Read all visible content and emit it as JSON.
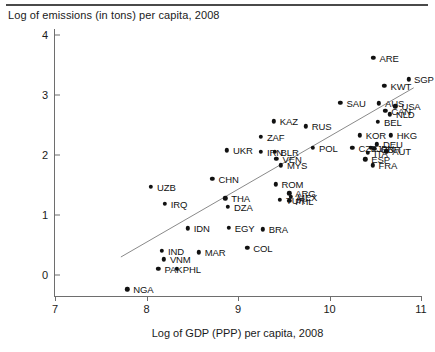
{
  "chart_data": {
    "type": "scatter",
    "title": "Log of emissions (in tons) per capita, 2008",
    "xlabel": "Log of GDP (PPP) per capita, 2008",
    "ylabel": "",
    "xlim": [
      7,
      11
    ],
    "ylim": [
      -0.35,
      4.1
    ],
    "xticks": [
      "7",
      "8",
      "9",
      "10",
      "11"
    ],
    "yticks": [
      "0",
      "1",
      "2",
      "3",
      "4"
    ],
    "grid": false,
    "legend": null,
    "trendline": {
      "x0": 7.72,
      "y0": 0.3,
      "x1": 10.92,
      "y1": 3.12
    },
    "points": [
      {
        "label": "ARE",
        "x": 10.48,
        "y": 3.62,
        "lx": 6
      },
      {
        "label": "SGP",
        "x": 10.87,
        "y": 3.26,
        "lx": 5
      },
      {
        "label": "KWT",
        "x": 10.6,
        "y": 3.15,
        "lx": 6
      },
      {
        "label": "AUS",
        "x": 10.54,
        "y": 2.86,
        "lx": 6
      },
      {
        "label": "USA",
        "x": 10.72,
        "y": 2.81,
        "lx": 6
      },
      {
        "label": "CAN",
        "x": 10.61,
        "y": 2.74,
        "lx": 6
      },
      {
        "label": "NLD",
        "x": 10.66,
        "y": 2.68,
        "lx": 6
      },
      {
        "label": "SAU",
        "x": 10.12,
        "y": 2.87,
        "lx": 6
      },
      {
        "label": "BEL",
        "x": 10.53,
        "y": 2.55,
        "lx": 6
      },
      {
        "label": "HKG",
        "x": 10.67,
        "y": 2.33,
        "lx": 6
      },
      {
        "label": "KOR",
        "x": 10.33,
        "y": 2.33,
        "lx": 6
      },
      {
        "label": "DEU",
        "x": 10.52,
        "y": 2.18,
        "lx": 6
      },
      {
        "label": "AUT",
        "x": 10.62,
        "y": 2.06,
        "lx": 6
      },
      {
        "label": "GBR",
        "x": 10.49,
        "y": 2.1,
        "lx": 6
      },
      {
        "label": "JPN",
        "x": 10.45,
        "y": 2.12,
        "lx": 6
      },
      {
        "label": "CZE",
        "x": 10.25,
        "y": 2.12,
        "lx": 6
      },
      {
        "label": "ITA",
        "x": 10.42,
        "y": 2.04,
        "lx": 6
      },
      {
        "label": "ESP",
        "x": 10.39,
        "y": 1.93,
        "lx": 6
      },
      {
        "label": "FRA",
        "x": 10.47,
        "y": 1.83,
        "lx": 6
      },
      {
        "label": "KAZ",
        "x": 9.39,
        "y": 2.56,
        "lx": 6
      },
      {
        "label": "RUS",
        "x": 9.74,
        "y": 2.48,
        "lx": 6
      },
      {
        "label": "ZAF",
        "x": 9.25,
        "y": 2.3,
        "lx": 6
      },
      {
        "label": "POL",
        "x": 9.82,
        "y": 2.12,
        "lx": 6
      },
      {
        "label": "UKR",
        "x": 8.88,
        "y": 2.08,
        "lx": 6
      },
      {
        "label": "IRN",
        "x": 9.25,
        "y": 2.05,
        "lx": 6
      },
      {
        "label": "BLR",
        "x": 9.4,
        "y": 2.05,
        "lx": 6
      },
      {
        "label": "VEN",
        "x": 9.42,
        "y": 1.94,
        "lx": 6
      },
      {
        "label": "MYS",
        "x": 9.47,
        "y": 1.83,
        "lx": 6
      },
      {
        "label": "CHN",
        "x": 8.72,
        "y": 1.6,
        "lx": 6
      },
      {
        "label": "ROM",
        "x": 9.41,
        "y": 1.51,
        "lx": 6
      },
      {
        "label": "ARG",
        "x": 9.56,
        "y": 1.36,
        "lx": 6
      },
      {
        "label": "MEX",
        "x": 9.58,
        "y": 1.3,
        "lx": 6
      },
      {
        "label": "TUR",
        "x": 9.46,
        "y": 1.25,
        "lx": 6
      },
      {
        "label": "PHL",
        "x": 9.56,
        "y": 1.24,
        "lx": 6
      },
      {
        "label": "THA",
        "x": 8.86,
        "y": 1.28,
        "lx": 6
      },
      {
        "label": "DZA",
        "x": 8.89,
        "y": 1.14,
        "lx": 6
      },
      {
        "label": "UZB",
        "x": 8.05,
        "y": 1.47,
        "lx": 6
      },
      {
        "label": "IRQ",
        "x": 8.2,
        "y": 1.19,
        "lx": 6
      },
      {
        "label": "EGY",
        "x": 8.9,
        "y": 0.79,
        "lx": 6
      },
      {
        "label": "IDN",
        "x": 8.45,
        "y": 0.78,
        "lx": 6
      },
      {
        "label": "BRA",
        "x": 9.27,
        "y": 0.76,
        "lx": 6
      },
      {
        "label": "COL",
        "x": 9.1,
        "y": 0.45,
        "lx": 6
      },
      {
        "label": "MAR",
        "x": 8.57,
        "y": 0.38,
        "lx": 6
      },
      {
        "label": "IND",
        "x": 8.17,
        "y": 0.4,
        "lx": 6
      },
      {
        "label": "VNM",
        "x": 8.19,
        "y": 0.26,
        "lx": 6
      },
      {
        "label": "PAK",
        "x": 8.13,
        "y": 0.1,
        "lx": 6
      },
      {
        "label": "PHL2",
        "x": 8.33,
        "y": 0.1,
        "lx": 6,
        "display": "PHL"
      },
      {
        "label": "NGA",
        "x": 7.79,
        "y": -0.24,
        "lx": 6
      }
    ]
  }
}
